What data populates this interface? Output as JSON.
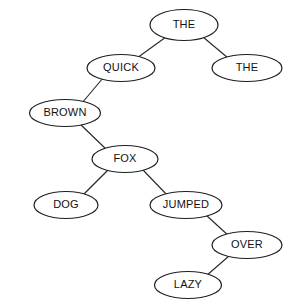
{
  "diagram": {
    "type": "binary-tree",
    "title": "",
    "background_color": "#ffffff",
    "node_fill_color": "#ffffff",
    "node_stroke_color": "#1f1f1f",
    "edge_color": "#2b2b2b",
    "text_color": "#111111",
    "nodes": [
      {
        "id": "n0",
        "label": "THE",
        "cx": 184,
        "cy": 25,
        "rx": 34,
        "ry": 15.5
      },
      {
        "id": "n1",
        "label": "QUICK",
        "cx": 121,
        "cy": 68,
        "rx": 34,
        "ry": 13.5
      },
      {
        "id": "n2",
        "label": "THE",
        "cx": 247,
        "cy": 68,
        "rx": 35,
        "ry": 13.5
      },
      {
        "id": "n3",
        "label": "BROWN",
        "cx": 65,
        "cy": 113,
        "rx": 35.5,
        "ry": 13.5
      },
      {
        "id": "n4",
        "label": "FOX",
        "cx": 125,
        "cy": 159,
        "rx": 33,
        "ry": 13.5
      },
      {
        "id": "n5",
        "label": "DOG",
        "cx": 66,
        "cy": 205,
        "rx": 32,
        "ry": 13.5
      },
      {
        "id": "n6",
        "label": "JUMPED",
        "cx": 186,
        "cy": 205,
        "rx": 36,
        "ry": 13.5
      },
      {
        "id": "n7",
        "label": "OVER",
        "cx": 247,
        "cy": 245,
        "rx": 35,
        "ry": 13.5
      },
      {
        "id": "n8",
        "label": "LAZY",
        "cx": 188,
        "cy": 285,
        "rx": 33.5,
        "ry": 13.5
      }
    ],
    "edges": [
      {
        "from": "n0",
        "to": "n1",
        "relation": "left-child",
        "x1": 166,
        "y1": 37,
        "x2": 137,
        "y2": 58
      },
      {
        "from": "n0",
        "to": "n2",
        "relation": "right-child",
        "x1": 203,
        "y1": 37,
        "x2": 228,
        "y2": 58
      },
      {
        "from": "n1",
        "to": "n3",
        "relation": "left-child",
        "x1": 103,
        "y1": 78,
        "x2": 82,
        "y2": 103
      },
      {
        "from": "n3",
        "to": "n4",
        "relation": "right-child",
        "x1": 80,
        "y1": 124,
        "x2": 107,
        "y2": 150
      },
      {
        "from": "n4",
        "to": "n5",
        "relation": "left-child",
        "x1": 108,
        "y1": 170,
        "x2": 83,
        "y2": 195
      },
      {
        "from": "n4",
        "to": "n6",
        "relation": "right-child",
        "x1": 143,
        "y1": 170,
        "x2": 168,
        "y2": 196
      },
      {
        "from": "n6",
        "to": "n7",
        "relation": "right-child",
        "x1": 206,
        "y1": 215,
        "x2": 230,
        "y2": 237
      },
      {
        "from": "n7",
        "to": "n8",
        "relation": "left-child",
        "x1": 229,
        "y1": 256,
        "x2": 206,
        "y2": 276
      }
    ]
  }
}
